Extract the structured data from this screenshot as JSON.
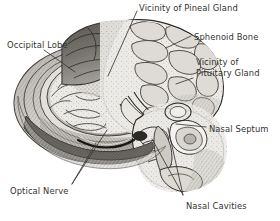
{
  "figure": {
    "background_color": "#ffffff",
    "ink_color": "#33322f",
    "style": "grayscale engraving / halftone illustration",
    "width": 280,
    "height": 221
  },
  "labels": [
    {
      "id": "pineal",
      "text": "Vicinity of Pineal Gland",
      "x": 139,
      "y": 3,
      "lines": 1
    },
    {
      "id": "sphenoid",
      "text": "Sphenoid Bone",
      "x": 194,
      "y": 32,
      "lines": 1
    },
    {
      "id": "pituitary_l1",
      "text": "Vicinity of",
      "x": 196,
      "y": 57,
      "lines": 1
    },
    {
      "id": "pituitary_l2",
      "text": "Pituitary Gland",
      "x": 196,
      "y": 68,
      "lines": 1
    },
    {
      "id": "occipital",
      "text": "Occipital Lobe",
      "x": 7,
      "y": 40,
      "lines": 1
    },
    {
      "id": "septum",
      "text": "Nasal Septum",
      "x": 209,
      "y": 124,
      "lines": 1
    },
    {
      "id": "optical",
      "text": "Optical Nerve",
      "x": 10,
      "y": 186,
      "lines": 1
    },
    {
      "id": "cavities",
      "text": "Nasal Cavities",
      "x": 186,
      "y": 201,
      "lines": 1
    }
  ],
  "leader_lines": [
    {
      "id": "leader-pineal",
      "from": [
        137,
        11
      ],
      "to": [
        108,
        76
      ]
    },
    {
      "id": "leader-sphenoid",
      "from": [
        191,
        36
      ],
      "to": [
        166,
        48
      ]
    },
    {
      "id": "leader-pituitary",
      "from": [
        193,
        78
      ],
      "to": [
        176,
        84
      ]
    },
    {
      "id": "leader-occipital",
      "from": [
        44,
        50
      ],
      "to": [
        75,
        72
      ]
    },
    {
      "id": "leader-septum",
      "from": [
        206,
        127
      ],
      "to": [
        176,
        124
      ]
    },
    {
      "id": "leader-optical-a",
      "from": [
        72,
        184
      ],
      "to": [
        96,
        143
      ]
    },
    {
      "id": "leader-optical-b",
      "from": [
        72,
        184
      ],
      "to": [
        107,
        130
      ]
    },
    {
      "id": "leader-cavities-a",
      "from": [
        183,
        195
      ],
      "to": [
        152,
        139
      ]
    },
    {
      "id": "leader-cavities-b",
      "from": [
        183,
        195
      ],
      "to": [
        168,
        128
      ]
    }
  ],
  "anatomy_parts": [
    "cerebrum",
    "cerebellum",
    "corpus callosum",
    "brain stem",
    "skull cranium shell",
    "sphenoid bone",
    "nasal cavity",
    "nasal septum",
    "optic nerve",
    "pituitary fossa"
  ]
}
